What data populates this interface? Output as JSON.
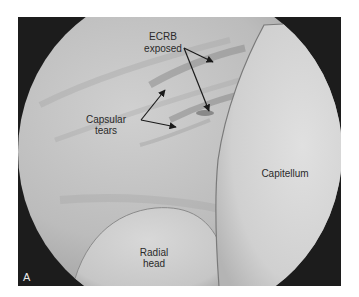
{
  "figure": {
    "panel_label": "A",
    "colors": {
      "frame": "#1c1c1c",
      "tissue": "#bdbdbd",
      "tissue_light": "#d2d2d2",
      "capitellum": "#d6d6d6",
      "radial_head": "#cfcfcf",
      "shadow": "#8e8e8e",
      "text": "#2a2a2a",
      "arrow": "#1a1a1a"
    },
    "labels": {
      "ecrb": {
        "line1": "ECRB",
        "line2": "exposed"
      },
      "capsular": {
        "line1": "Capsular",
        "line2": "tears"
      },
      "capitellum": {
        "line1": "Capitellum"
      },
      "radial_head": {
        "line1": "Radial",
        "line2": "head"
      }
    }
  }
}
